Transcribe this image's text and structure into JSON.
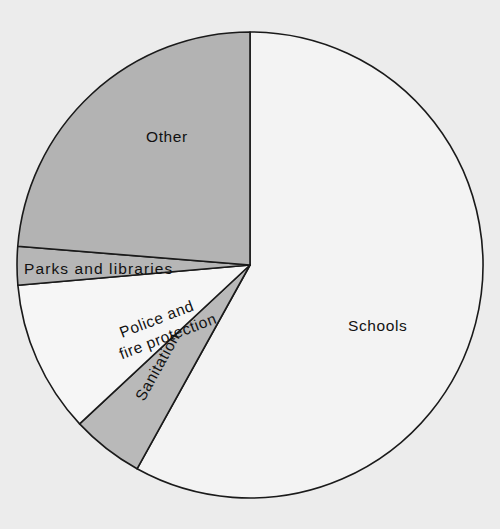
{
  "chart_data": {
    "type": "pie",
    "title": "",
    "subtitle": "",
    "xlabel": "",
    "ylabel": "",
    "legend_position": "none",
    "grid": false,
    "labels_inside_slices": true,
    "start_angle_deg": 0,
    "direction": "clockwise",
    "categories": [
      "Schools",
      "Sanitation",
      "Police and fire protection",
      "Parks and libraries",
      "Other"
    ],
    "values": [
      58.0,
      5.0,
      10.5,
      2.7,
      23.8
    ],
    "slices": [
      {
        "label": "Schools",
        "value": 58.0,
        "start_deg": 0,
        "end_deg": 209,
        "color": "#f3f3f3",
        "label_x": 348,
        "label_y": 331,
        "label_rotation": 0
      },
      {
        "label": "Sanitation",
        "value": 5.0,
        "start_deg": 209,
        "end_deg": 227,
        "color": "#b9b9b9",
        "label_x": 144,
        "label_y": 402,
        "label_rotation": -61
      },
      {
        "label_line1": "Police and",
        "label_line2": "fire protection",
        "label": "Police and fire protection",
        "value": 10.5,
        "start_deg": 227,
        "end_deg": 265,
        "color": "#f6f6f6",
        "label_x": 122,
        "label_y": 338,
        "label_rotation": -21
      },
      {
        "label": "Parks and libraries",
        "value": 2.7,
        "start_deg": 265,
        "end_deg": 274.6,
        "color": "#b6b6b6",
        "label_x": 24,
        "label_y": 274,
        "label_rotation": 0
      },
      {
        "label": "Other",
        "value": 23.8,
        "start_deg": 274.6,
        "end_deg": 360,
        "color": "#b3b3b3",
        "label_x": 146,
        "label_y": 142,
        "label_rotation": 0
      }
    ],
    "geometry": {
      "center_x": 250,
      "center_y": 265,
      "radius": 233
    },
    "colors": {
      "background": "#ececec",
      "outline": "#1a1a1a",
      "schools_fill": "#f3f3f3",
      "sanitation_fill": "#b9b9b9",
      "police_fill": "#f6f6f6",
      "parks_fill": "#b6b6b6",
      "other_fill": "#b3b3b3"
    }
  }
}
